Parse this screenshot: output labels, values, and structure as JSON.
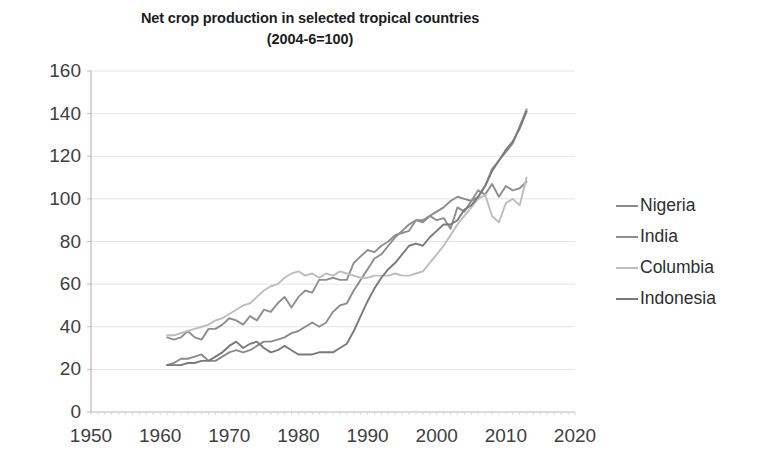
{
  "chart_data": {
    "type": "line",
    "title": "Net crop production in selected tropical countries (2004-6=100)",
    "title_line1": "Net crop production in selected tropical countries",
    "title_line2": "(2004-6=100)",
    "xlabel": "",
    "ylabel": "",
    "xlim": [
      1950,
      2020
    ],
    "ylim": [
      0,
      160
    ],
    "xticks": [
      1950,
      1960,
      1970,
      1980,
      1990,
      2000,
      2010,
      2020
    ],
    "yticks": [
      0,
      20,
      40,
      60,
      80,
      100,
      120,
      140,
      160
    ],
    "grid": true,
    "grid_color": "#e4e4e4",
    "legend_position": "right",
    "x": [
      1961,
      1962,
      1963,
      1964,
      1965,
      1966,
      1967,
      1968,
      1969,
      1970,
      1971,
      1972,
      1973,
      1974,
      1975,
      1976,
      1977,
      1978,
      1979,
      1980,
      1981,
      1982,
      1983,
      1984,
      1985,
      1986,
      1987,
      1988,
      1989,
      1990,
      1991,
      1992,
      1993,
      1994,
      1995,
      1996,
      1997,
      1998,
      1999,
      2000,
      2001,
      2002,
      2003,
      2004,
      2005,
      2006,
      2007,
      2008,
      2009,
      2010,
      2011,
      2012,
      2013
    ],
    "series": [
      {
        "name": "Nigeria",
        "color": "#8c8c8c",
        "values": [
          22,
          23,
          25,
          25,
          26,
          27,
          24,
          24,
          26,
          28,
          29,
          28,
          29,
          31,
          33,
          33,
          34,
          35,
          37,
          38,
          40,
          42,
          40,
          42,
          47,
          50,
          51,
          57,
          62,
          67,
          72,
          74,
          78,
          82,
          85,
          88,
          90,
          90,
          92,
          94,
          96,
          99,
          101,
          100,
          99,
          101,
          106,
          114,
          118,
          122,
          126,
          134,
          142
        ]
      },
      {
        "name": "India",
        "color": "#8f8f8f",
        "values": [
          35,
          34,
          35,
          38,
          35,
          34,
          39,
          39,
          41,
          44,
          43,
          41,
          45,
          43,
          48,
          47,
          51,
          54,
          49,
          54,
          57,
          56,
          62,
          62,
          63,
          62,
          62,
          70,
          73,
          76,
          75,
          78,
          80,
          83,
          84,
          85,
          90,
          89,
          92,
          90,
          91,
          86,
          96,
          94,
          99,
          104,
          102,
          107,
          101,
          106,
          104,
          105,
          108
        ]
      },
      {
        "name": "Columbia",
        "color": "#bdbdbd",
        "values": [
          36,
          36,
          37,
          38,
          39,
          40,
          41,
          43,
          44,
          46,
          48,
          50,
          51,
          54,
          57,
          59,
          60,
          63,
          65,
          66,
          64,
          65,
          63,
          65,
          64,
          66,
          65,
          64,
          63,
          63,
          64,
          64,
          64,
          65,
          64,
          64,
          65,
          66,
          70,
          74,
          78,
          83,
          88,
          92,
          96,
          100,
          102,
          92,
          89,
          98,
          100,
          97,
          110
        ]
      },
      {
        "name": "Indonesia",
        "color": "#7a7a7a",
        "values": [
          22,
          22,
          22,
          23,
          23,
          24,
          24,
          26,
          28,
          31,
          33,
          30,
          32,
          33,
          30,
          28,
          29,
          31,
          29,
          27,
          27,
          27,
          28,
          28,
          28,
          30,
          32,
          38,
          45,
          52,
          58,
          63,
          67,
          70,
          74,
          78,
          79,
          78,
          82,
          85,
          88,
          88,
          90,
          95,
          97,
          101,
          106,
          113,
          118,
          123,
          127,
          133,
          141
        ]
      }
    ]
  },
  "legend": {
    "items": [
      {
        "label": "Nigeria"
      },
      {
        "label": "India"
      },
      {
        "label": "Columbia"
      },
      {
        "label": "Indonesia"
      }
    ]
  }
}
